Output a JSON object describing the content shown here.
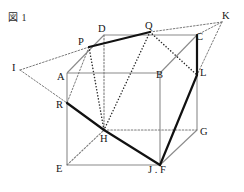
{
  "figure": {
    "caption": "図 1",
    "width": 244,
    "height": 192,
    "background": "#ffffff"
  },
  "style": {
    "edge_color": "#8a8a8a",
    "edge_width": 1.1,
    "hidden_edge_color": "#8a8a8a",
    "thick_color": "#111111",
    "thick_width": 2.2,
    "dotted_color": "#2a2a2a",
    "dotted_width": 1.5,
    "thin_dotted_color": "#7a7a7a",
    "label_color": "#141414"
  },
  "points": {
    "A": {
      "label": "A",
      "x": 67,
      "y": 73,
      "lx": 57,
      "ly": 80
    },
    "B": {
      "label": "B",
      "x": 160,
      "y": 73,
      "lx": 157,
      "ly": 80
    },
    "C": {
      "label": "C",
      "x": 197,
      "y": 35,
      "lx": 196,
      "ly": 41
    },
    "D": {
      "label": "D",
      "x": 104,
      "y": 35,
      "lx": 98,
      "ly": 33
    },
    "E": {
      "label": "E",
      "x": 67,
      "y": 165,
      "lx": 57,
      "ly": 175
    },
    "F": {
      "label": "F",
      "x": 160,
      "y": 165,
      "lx": 166,
      "ly": 176
    },
    "G": {
      "label": "G",
      "x": 197,
      "y": 130,
      "lx": 200,
      "ly": 137
    },
    "H": {
      "label": "H",
      "x": 104,
      "y": 130,
      "lx": 101,
      "ly": 141
    },
    "I": {
      "label": "I",
      "x": 20,
      "y": 70,
      "lx": 13,
      "ly": 74
    },
    "J": {
      "label": "J",
      "x": 160,
      "y": 165,
      "lx": 150,
      "ly": 176
    },
    "K": {
      "label": "K",
      "x": 222,
      "y": 22,
      "lx": 223,
      "ly": 20
    },
    "L": {
      "label": "L",
      "x": 197,
      "y": 75,
      "lx": 200,
      "ly": 78
    },
    "P": {
      "label": "P",
      "x": 89,
      "y": 47,
      "lx": 80,
      "ly": 46
    },
    "Q": {
      "label": "Q",
      "x": 150,
      "y": 32,
      "lx": 146,
      "ly": 30
    },
    "R": {
      "label": "R",
      "x": 67,
      "y": 103,
      "lx": 57,
      "ly": 110
    }
  },
  "labels": [
    {
      "name": "vertex-label-D",
      "text": "D",
      "x": 98,
      "y": 24
    },
    {
      "name": "vertex-label-Q",
      "text": "Q",
      "x": 145,
      "y": 21
    },
    {
      "name": "vertex-label-K",
      "text": "K",
      "x": 222,
      "y": 11
    },
    {
      "name": "vertex-label-C",
      "text": "C",
      "x": 196,
      "y": 32
    },
    {
      "name": "vertex-label-P",
      "text": "P",
      "x": 78,
      "y": 37
    },
    {
      "name": "vertex-label-I",
      "text": "I",
      "x": 12,
      "y": 63
    },
    {
      "name": "vertex-label-A",
      "text": "A",
      "x": 57,
      "y": 72
    },
    {
      "name": "vertex-label-B",
      "text": "B",
      "x": 156,
      "y": 70
    },
    {
      "name": "vertex-label-L",
      "text": "L",
      "x": 200,
      "y": 68
    },
    {
      "name": "vertex-label-R",
      "text": "R",
      "x": 56,
      "y": 100
    },
    {
      "name": "vertex-label-G",
      "text": "G",
      "x": 200,
      "y": 127
    },
    {
      "name": "vertex-label-H",
      "text": "H",
      "x": 100,
      "y": 134
    },
    {
      "name": "vertex-label-E",
      "text": "E",
      "x": 56,
      "y": 164
    },
    {
      "name": "vertex-label-JF",
      "text": "J . F",
      "x": 148,
      "y": 165
    }
  ],
  "edges": {
    "solid_visible": [
      {
        "name": "edge-A-B",
        "from": "A",
        "to": "B"
      },
      {
        "name": "edge-A-E",
        "from": "A",
        "to": "E"
      },
      {
        "name": "edge-B-F",
        "from": "B",
        "to": "F"
      },
      {
        "name": "edge-E-F",
        "from": "E",
        "to": "F"
      },
      {
        "name": "edge-D-C",
        "from": "D",
        "to": "C"
      },
      {
        "name": "edge-C-G",
        "from": "C",
        "to": "G"
      },
      {
        "name": "edge-F-G",
        "from": "F",
        "to": "G"
      },
      {
        "name": "edge-A-D",
        "from": "A",
        "to": "D"
      },
      {
        "name": "edge-B-C",
        "from": "B",
        "to": "C"
      }
    ],
    "hidden_dotted": [
      {
        "name": "edge-D-H",
        "from": "D",
        "to": "H"
      },
      {
        "name": "edge-E-H",
        "from": "E",
        "to": "H"
      },
      {
        "name": "edge-H-G",
        "from": "H",
        "to": "G"
      }
    ],
    "thick_solid": [
      {
        "name": "segment-P-Q",
        "from": "P",
        "to": "Q"
      },
      {
        "name": "segment-R-H",
        "from": "R",
        "to": "H"
      },
      {
        "name": "segment-H-J",
        "from": "H",
        "to": "J"
      },
      {
        "name": "segment-J-L",
        "from": "J",
        "to": "L"
      },
      {
        "name": "segment-L-C",
        "from": "L",
        "to": "C"
      }
    ],
    "dotted_construction": [
      {
        "name": "segment-I-P",
        "from": "I",
        "to": "P"
      },
      {
        "name": "segment-I-R",
        "from": "I",
        "to": "R"
      },
      {
        "name": "segment-K-Q",
        "from": "K",
        "to": "Q"
      },
      {
        "name": "segment-K-C",
        "from": "K",
        "to": "C"
      },
      {
        "name": "segment-K-L",
        "from": "K",
        "to": "L"
      },
      {
        "name": "segment-P-H",
        "from": "P",
        "to": "H"
      },
      {
        "name": "segment-Q-H",
        "from": "Q",
        "to": "H"
      },
      {
        "name": "segment-Q-L",
        "from": "Q",
        "to": "L"
      },
      {
        "name": "segment-P-R",
        "from": "P",
        "to": "R"
      }
    ]
  }
}
